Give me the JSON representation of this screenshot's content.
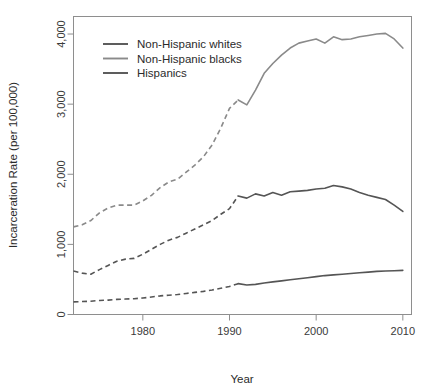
{
  "chart_data": {
    "type": "line",
    "title": "",
    "xlabel": "Year",
    "ylabel": "Incarceration Rate (per 100,000)",
    "xlim": [
      1972,
      2011
    ],
    "ylim": [
      0,
      4250
    ],
    "xticks": [
      1980,
      1990,
      2000,
      2010
    ],
    "xtick_labels": [
      "1980",
      "1990",
      "2000",
      "2010"
    ],
    "yticks": [
      0,
      1000,
      2000,
      3000,
      4000
    ],
    "ytick_labels": [
      "0",
      "1,000",
      "2,000",
      "3,000",
      "4,000"
    ],
    "grid": false,
    "legend_position": "top-left",
    "dash_break_year": 1991,
    "note_style": "values before 1991 drawn dashed, 1991 onward solid",
    "series": [
      {
        "name": "Non-Hispanic whites",
        "color": "#555555",
        "x": [
          1972,
          1973,
          1974,
          1975,
          1976,
          1977,
          1978,
          1979,
          1980,
          1981,
          1982,
          1983,
          1984,
          1985,
          1986,
          1987,
          1988,
          1989,
          1990,
          1991,
          1992,
          1993,
          1994,
          1995,
          1996,
          1997,
          1998,
          1999,
          2000,
          2001,
          2002,
          2003,
          2004,
          2005,
          2006,
          2007,
          2008,
          2009,
          2010
        ],
        "values": [
          620,
          590,
          575,
          640,
          700,
          760,
          790,
          800,
          860,
          930,
          1000,
          1060,
          1100,
          1160,
          1220,
          1280,
          1340,
          1430,
          1510,
          1690,
          1660,
          1720,
          1690,
          1740,
          1700,
          1750,
          1760,
          1770,
          1790,
          1800,
          1840,
          1820,
          1790,
          1740,
          1700,
          1670,
          1640,
          1560,
          1470
        ]
      },
      {
        "name": "Non-Hispanic blacks",
        "color": "#8a8a8a",
        "x": [
          1972,
          1973,
          1974,
          1975,
          1976,
          1977,
          1978,
          1979,
          1980,
          1981,
          1982,
          1983,
          1984,
          1985,
          1986,
          1987,
          1988,
          1989,
          1990,
          1991,
          1992,
          1993,
          1994,
          1995,
          1996,
          1997,
          1998,
          1999,
          2000,
          2001,
          2002,
          2003,
          2004,
          2005,
          2006,
          2007,
          2008,
          2009,
          2010
        ],
        "values": [
          1250,
          1280,
          1340,
          1450,
          1520,
          1560,
          1560,
          1560,
          1620,
          1700,
          1810,
          1890,
          1930,
          2030,
          2130,
          2250,
          2420,
          2660,
          2940,
          3060,
          2990,
          3200,
          3440,
          3580,
          3700,
          3800,
          3870,
          3900,
          3930,
          3870,
          3960,
          3920,
          3930,
          3960,
          3980,
          4000,
          4010,
          3930,
          3800
        ]
      },
      {
        "name": "Hispanics",
        "color": "#555555",
        "x": [
          1972,
          1973,
          1974,
          1975,
          1976,
          1977,
          1978,
          1979,
          1980,
          1981,
          1982,
          1983,
          1984,
          1985,
          1986,
          1987,
          1988,
          1989,
          1990,
          1991,
          1992,
          1993,
          1994,
          1995,
          1996,
          1997,
          1998,
          1999,
          2000,
          2001,
          2002,
          2003,
          2004,
          2005,
          2006,
          2007,
          2008,
          2009,
          2010
        ],
        "values": [
          180,
          185,
          190,
          200,
          205,
          215,
          220,
          225,
          235,
          250,
          265,
          275,
          285,
          300,
          315,
          330,
          350,
          375,
          400,
          440,
          420,
          430,
          450,
          465,
          480,
          495,
          510,
          525,
          540,
          555,
          565,
          575,
          585,
          595,
          605,
          615,
          620,
          625,
          630
        ]
      }
    ]
  },
  "legend": {
    "items": [
      {
        "label": "Non-Hispanic whites",
        "color": "#555555"
      },
      {
        "label": "Non-Hispanic blacks",
        "color": "#8a8a8a"
      },
      {
        "label": "Hispanics",
        "color": "#555555"
      }
    ]
  },
  "axes": {
    "x_label": "Year",
    "y_label": "Incarceration Rate (per 100,000)"
  }
}
